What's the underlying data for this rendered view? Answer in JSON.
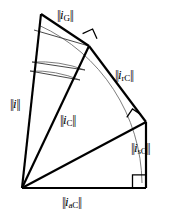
{
  "figure": {
    "background_color": "#ffffff",
    "stroke_color": "#000000",
    "thin_stroke_color": "#5a5a5a",
    "width": 174,
    "height": 216
  },
  "labels": {
    "apparent_total": {
      "name": "i",
      "norm_prefix": "||",
      "norm_suffix": "||",
      "subscript": ""
    },
    "generalized": {
      "name": "i",
      "norm_prefix": "||",
      "norm_suffix": "||",
      "subscript": "G"
    },
    "reactive_collective": {
      "name": "i",
      "norm_prefix": "||",
      "norm_suffix": "||",
      "subscript": "rC"
    },
    "scattered_collective": {
      "name": "i",
      "norm_prefix": "||",
      "norm_suffix": "||",
      "subscript": "sC"
    },
    "active_collective": {
      "name": "i",
      "norm_prefix": "||",
      "norm_suffix": "||",
      "subscript": "aC"
    },
    "collective": {
      "name": "i",
      "norm_prefix": "||",
      "norm_suffix": "||",
      "subscript": "C"
    }
  },
  "geometry": {
    "origin": {
      "x": 22,
      "y": 188
    },
    "top_apex": {
      "x": 41,
      "y": 14
    },
    "upper_right": {
      "x": 89,
      "y": 46
    },
    "mid_right": {
      "x": 146,
      "y": 122
    },
    "bottom_right": {
      "x": 146,
      "y": 188
    },
    "right_angles": [
      {
        "x": 89,
        "y": 46,
        "label": "right-angle-top"
      },
      {
        "x": 146,
        "y": 122,
        "label": "right-angle-middle"
      },
      {
        "x": 146,
        "y": 188,
        "label": "right-angle-bottom"
      }
    ],
    "arcs": [
      {
        "name": "arc-outer",
        "radius": 176
      },
      {
        "name": "arc-inner-upper",
        "radius": 130
      },
      {
        "name": "arc-inner-lower",
        "radius": 120
      }
    ]
  }
}
